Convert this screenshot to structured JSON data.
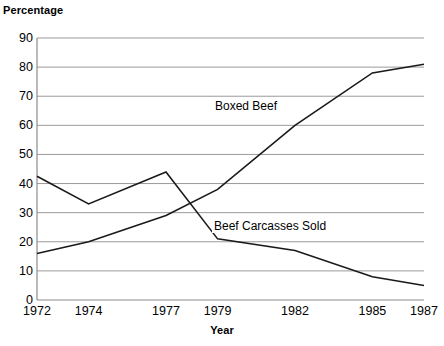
{
  "chart_data": {
    "type": "line",
    "title": "",
    "xlabel": "Year",
    "ylabel": "Percentage",
    "x": [
      1972,
      1974,
      1977,
      1979,
      1982,
      1985,
      1987
    ],
    "xticklabels": [
      "1972",
      "1974",
      "1977",
      "1979",
      "1982",
      "1985",
      "1987"
    ],
    "yticklabels": [
      "0",
      "10",
      "20",
      "30",
      "40",
      "50",
      "60",
      "70",
      "80",
      "90"
    ],
    "ylim": [
      0,
      90
    ],
    "ytick_step": 10,
    "grid": "horizontal",
    "legend_position": "inline-annotations",
    "line_color": "#1a1a1a",
    "grid_color": "#9a9a9a",
    "axis_color": "#8c8c8c",
    "series": [
      {
        "name": "Boxed Beef",
        "values": [
          16,
          20,
          29,
          38,
          60,
          78,
          81
        ]
      },
      {
        "name": "Beef Carcasses Sold",
        "values": [
          42.5,
          33,
          44,
          21,
          17,
          8,
          5
        ]
      }
    ]
  },
  "labels": {
    "y_axis_title": "Percentage",
    "x_axis_title": "Year",
    "series_boxed_beef": "Boxed Beef",
    "series_beef_carcasses": "Beef Carcasses Sold"
  }
}
